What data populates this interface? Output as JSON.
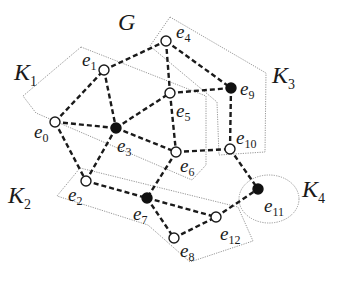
{
  "title": "G",
  "regions": [
    {
      "id": "K1",
      "label": "K",
      "sub": "1",
      "label_x": 14,
      "label_y": 80,
      "points": "81,47 206,96 206,165 192,180 36,113 23,96"
    },
    {
      "id": "K2",
      "label": "K",
      "sub": "2",
      "label_x": 8,
      "label_y": 203,
      "points": "80,168 238,207 253,241 190,262 148,225 57,196"
    },
    {
      "id": "K3",
      "label": "K",
      "sub": "3",
      "label_x": 272,
      "label_y": 83,
      "points": "170,17 266,73 265,152 219,155 217,102 150,46"
    },
    {
      "id": "K4",
      "label": "K",
      "sub": "4",
      "label_x": 302,
      "label_y": 197,
      "ellipse": {
        "cx": 269,
        "cy": 199,
        "rx": 30,
        "ry": 24
      }
    }
  ],
  "nodes": [
    {
      "id": "e0",
      "label": "e",
      "sub": "0",
      "x": 55,
      "y": 122,
      "filled": false,
      "lx": 34,
      "ly": 138
    },
    {
      "id": "e1",
      "label": "e",
      "sub": "1",
      "x": 104,
      "y": 70,
      "filled": false,
      "lx": 82,
      "ly": 66
    },
    {
      "id": "e2",
      "label": "e",
      "sub": "2",
      "x": 86,
      "y": 181,
      "filled": false,
      "lx": 68,
      "ly": 201
    },
    {
      "id": "e3",
      "label": "e",
      "sub": "3",
      "x": 116,
      "y": 128,
      "filled": true,
      "lx": 117,
      "ly": 152
    },
    {
      "id": "e4",
      "label": "e",
      "sub": "4",
      "x": 166,
      "y": 41,
      "filled": false,
      "lx": 176,
      "ly": 38
    },
    {
      "id": "e5",
      "label": "e",
      "sub": "5",
      "x": 170,
      "y": 93,
      "filled": false,
      "lx": 176,
      "ly": 117
    },
    {
      "id": "e6",
      "label": "e",
      "sub": "6",
      "x": 176,
      "y": 152,
      "filled": false,
      "lx": 180,
      "ly": 172
    },
    {
      "id": "e7",
      "label": "e",
      "sub": "7",
      "x": 147,
      "y": 198,
      "filled": true,
      "lx": 133,
      "ly": 220
    },
    {
      "id": "e8",
      "label": "e",
      "sub": "8",
      "x": 174,
      "y": 238,
      "filled": false,
      "lx": 180,
      "ly": 257
    },
    {
      "id": "e9",
      "label": "e",
      "sub": "9",
      "x": 231,
      "y": 88,
      "filled": true,
      "lx": 240,
      "ly": 95
    },
    {
      "id": "e10",
      "label": "e",
      "sub": "10",
      "x": 230,
      "y": 149,
      "filled": false,
      "lx": 236,
      "ly": 144
    },
    {
      "id": "e11",
      "label": "e",
      "sub": "11",
      "x": 258,
      "y": 189,
      "filled": true,
      "lx": 264,
      "ly": 212
    },
    {
      "id": "e12",
      "label": "e",
      "sub": "12",
      "x": 216,
      "y": 217,
      "filled": false,
      "lx": 220,
      "ly": 240
    }
  ],
  "edges": [
    [
      "e0",
      "e1"
    ],
    [
      "e0",
      "e3"
    ],
    [
      "e0",
      "e2"
    ],
    [
      "e1",
      "e3"
    ],
    [
      "e1",
      "e4"
    ],
    [
      "e3",
      "e5"
    ],
    [
      "e3",
      "e6"
    ],
    [
      "e3",
      "e2"
    ],
    [
      "e4",
      "e5"
    ],
    [
      "e4",
      "e9"
    ],
    [
      "e5",
      "e9"
    ],
    [
      "e5",
      "e6"
    ],
    [
      "e6",
      "e10"
    ],
    [
      "e6",
      "e7"
    ],
    [
      "e9",
      "e10"
    ],
    [
      "e10",
      "e11"
    ],
    [
      "e2",
      "e7"
    ],
    [
      "e7",
      "e12"
    ],
    [
      "e7",
      "e8"
    ],
    [
      "e8",
      "e12"
    ],
    [
      "e12",
      "e11"
    ]
  ],
  "title_pos": {
    "x": 118,
    "y": 30
  }
}
